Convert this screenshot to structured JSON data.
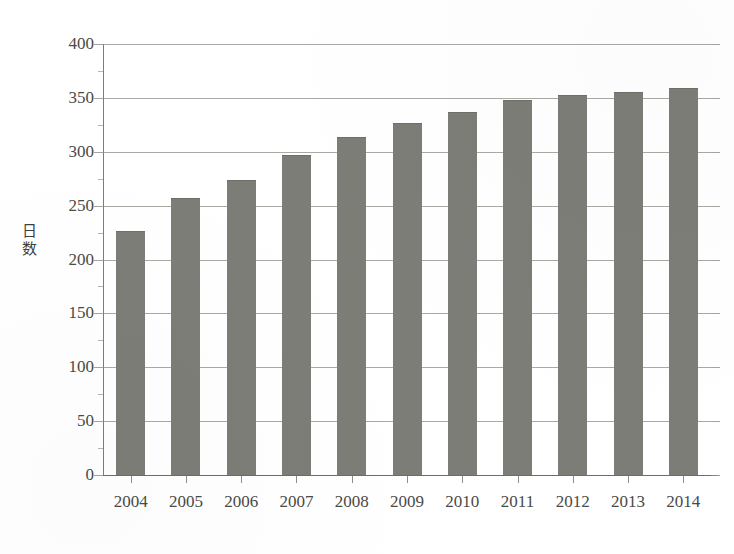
{
  "caption": {
    "cut_off_text": "— — — — — — — — — — — — —"
  },
  "chart_data": {
    "type": "bar",
    "title": "",
    "xlabel": "",
    "ylabel": "日数",
    "categories": [
      "2004",
      "2005",
      "2006",
      "2007",
      "2008",
      "2009",
      "2010",
      "2011",
      "2012",
      "2013",
      "2014"
    ],
    "values": [
      226,
      256,
      273,
      296,
      313,
      326,
      336,
      347,
      352,
      355,
      358
    ],
    "ylim": [
      0,
      400
    ],
    "ytick_labels": [
      "400",
      "350",
      "300",
      "250",
      "200",
      "150",
      "100",
      "50",
      "0"
    ],
    "ytick_values": [
      400,
      350,
      300,
      250,
      200,
      150,
      100,
      50,
      0
    ],
    "ytick_step": 50,
    "grid": true,
    "legend": false,
    "legend_position": "none",
    "bar_color": "#7d7d78",
    "axis_color": "#7d7d76",
    "text_color": "#4a4a46",
    "series": [
      {
        "name": "日数",
        "values": [
          226,
          256,
          273,
          296,
          313,
          326,
          336,
          347,
          352,
          355,
          358
        ]
      }
    ]
  },
  "y_axis_title_chars": [
    "日",
    "数"
  ]
}
